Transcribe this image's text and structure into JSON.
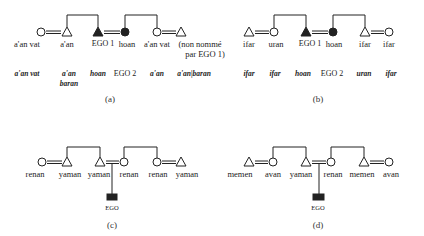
{
  "panels": {
    "a": {
      "caption": "(a)",
      "row1": [
        "a'an vat",
        "a'an",
        "EGO 1",
        "hoan",
        "a'an vat",
        "(non nommé",
        "par EGO 1)"
      ],
      "row2": [
        "a'an vat",
        "a'an",
        "baran",
        "hoan",
        "EGO 2",
        "a'an",
        "a'an|baran"
      ]
    },
    "b": {
      "caption": "(b)",
      "row1": [
        "ifar",
        "uran",
        "EGO 1",
        "hoan",
        "ifar",
        "ifar"
      ],
      "row2": [
        "ifar",
        "ifar",
        "hoan",
        "EGO 2",
        "uran",
        "ifar"
      ]
    },
    "c": {
      "caption": "(c)",
      "row1": [
        "renan",
        "yaman",
        "yaman",
        "renan",
        "renan",
        "yaman"
      ],
      "ego": "EGO"
    },
    "d": {
      "caption": "(d)",
      "row1": [
        "memen",
        "avan",
        "yaman",
        "renan",
        "memen",
        "avan"
      ],
      "ego": "EGO"
    }
  },
  "legend_symbols": {
    "circle": "female",
    "triangle": "male",
    "filled": "ego",
    "double_line": "marriage",
    "bracket": "sibling link"
  }
}
